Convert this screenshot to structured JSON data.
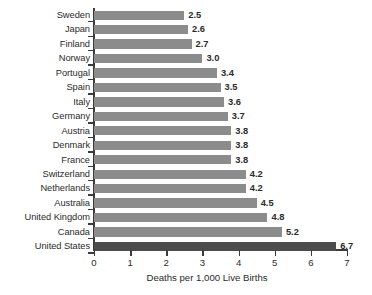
{
  "chart_data": {
    "type": "bar",
    "orientation": "horizontal",
    "title": "",
    "xlabel": "Deaths per 1,000 Live Births",
    "ylabel": "",
    "xlim": [
      0,
      7
    ],
    "xticks": [
      0,
      1,
      2,
      3,
      4,
      5,
      6,
      7
    ],
    "xtick_labels": [
      "0",
      "1",
      "2",
      "3",
      "4",
      "5",
      "6",
      "7"
    ],
    "grid": false,
    "legend": null,
    "categories": [
      "Sweden",
      "Japan",
      "Finland",
      "Norway",
      "Portugal",
      "Spain",
      "Italy",
      "Germany",
      "Austria",
      "Denmark",
      "France",
      "Switzerland",
      "Netherlands",
      "Australia",
      "United Kingdom",
      "Canada",
      "United States"
    ],
    "values": [
      2.5,
      2.6,
      2.7,
      3.0,
      3.4,
      3.5,
      3.6,
      3.7,
      3.8,
      3.8,
      3.8,
      4.2,
      4.2,
      4.5,
      4.8,
      5.2,
      6.7
    ],
    "value_labels": [
      "2.5",
      "2.6",
      "2.7",
      "3.0",
      "3.4",
      "3.5",
      "3.6",
      "3.7",
      "3.8",
      "3.8",
      "3.8",
      "4.2",
      "4.2",
      "4.5",
      "4.8",
      "5.2",
      "6.7"
    ],
    "highlighted_category": "United States",
    "colors": {
      "bar": "#8c8c8c",
      "bar_highlight": "#4c4c4c",
      "axis": "#3b3b3b",
      "text": "#2b2b2b",
      "background": "#ffffff"
    }
  }
}
